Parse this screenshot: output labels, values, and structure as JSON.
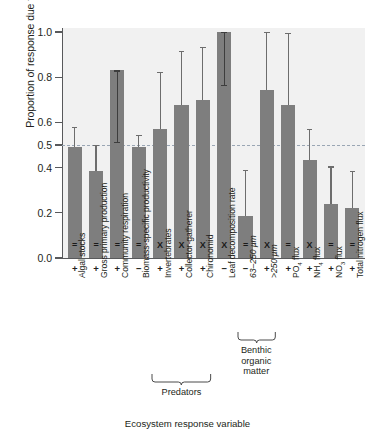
{
  "chart_data": {
    "type": "bar",
    "title": "",
    "xlabel": "Ecosystem response variable",
    "ylabel": "Proportion of response due to evolution",
    "ylim": [
      0.0,
      1.05
    ],
    "yticks": [
      "0.0",
      "0.2",
      "0.4",
      "0.5",
      "0.6",
      "0.8",
      "1.0"
    ],
    "ytick_values": [
      0.0,
      0.2,
      0.4,
      0.5,
      0.6,
      0.8,
      1.0
    ],
    "grid": false,
    "legend": "none",
    "reference_line": 0.5,
    "categories": [
      "Algal stocks",
      "Gross primary production",
      "Community respiration",
      "Biomass-specific productivity",
      "Invertebrates",
      "Collector-gatherer",
      "Chironomid",
      "Leaf decomposition rate",
      "63–250 µm",
      ">250 µm",
      "PO4 flux",
      "NH4 flux",
      "NO3 flux",
      "Total nitrogen flux"
    ],
    "values": [
      0.49,
      0.385,
      0.83,
      0.49,
      0.57,
      0.675,
      0.7,
      1.0,
      0.185,
      0.745,
      0.675,
      0.435,
      0.24,
      0.22
    ],
    "error_upper": [
      0.58,
      0.5,
      0.83,
      0.545,
      0.825,
      0.915,
      0.935,
      1.0,
      0.39,
      1.0,
      0.995,
      0.57,
      0.405,
      0.385
    ],
    "error_lower": [
      0.49,
      0.385,
      0.515,
      0.49,
      0.57,
      0.675,
      0.7,
      0.765,
      0.185,
      0.745,
      0.675,
      0.435,
      0.24,
      0.22
    ],
    "signs": [
      "+",
      "+",
      "+",
      "−",
      "+",
      "+",
      "+",
      "−",
      "−",
      "+",
      "+",
      "+",
      "+",
      "+"
    ],
    "significance": [
      "=",
      "=",
      "=",
      "=",
      "X",
      "X",
      "X",
      "X",
      "=",
      "X",
      "=",
      "X",
      "=",
      "="
    ],
    "groups": [
      {
        "label": "Predators",
        "from": 4,
        "to": 6
      },
      {
        "label": "Benthic\norganic\nmatter",
        "from": 8,
        "to": 9
      }
    ],
    "colors": {
      "bar": "#7e7e7e",
      "plot_background": "#f1f1f1",
      "axis": "#58595b",
      "reference_line": "#9aa6b4",
      "error_bar": "#6d6d6d",
      "inner_error_bar": "#3d3d3d",
      "text": "#231f20"
    }
  },
  "category_labels": {
    "0": "Algal stocks",
    "1": "Gross primary production",
    "2": "Community respiration",
    "3": "Biomass-specific productivity",
    "4": "Invertebrates",
    "5": "Collector-gatherer",
    "6": "Chironomid",
    "7": "Leaf decomposition rate",
    "8": "63–250 µm",
    "9": ">250 µm",
    "10": "PO4 flux",
    "11": "NH4 flux",
    "12": "NO3 flux",
    "13": "Total nitrogen flux"
  }
}
